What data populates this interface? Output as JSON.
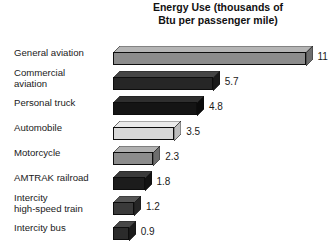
{
  "chart_data": {
    "type": "bar",
    "orientation": "horizontal",
    "title": "Energy Use (thousands of\nBtu per passenger mile)",
    "xlabel": "",
    "ylabel": "",
    "xlim": [
      0,
      11
    ],
    "grid": false,
    "legend": null,
    "style": "3d-isometric-horizontal-bars",
    "categories": [
      "General aviation",
      "Commercial\naviation",
      "Personal truck",
      "Automobile",
      "Motorcycle",
      "AMTRAK railroad",
      "Intercity\nhigh-speed train",
      "Intercity bus"
    ],
    "values": [
      11,
      5.7,
      4.8,
      3.5,
      2.3,
      1.8,
      1.2,
      0.9
    ],
    "value_labels": [
      "11",
      "5.7",
      "4.8",
      "3.5",
      "2.3",
      "1.8",
      "1.2",
      "0.9"
    ],
    "bar_colors": [
      "#8c8c8c",
      "#262626",
      "#141414",
      "#d8d8d8",
      "#8c8c8c",
      "#1c1c1c",
      "#3a3a3a",
      "#2b2b2b"
    ],
    "bar_top_colors": [
      "#b5b5b5",
      "#454545",
      "#2e2e2e",
      "#eaeaea",
      "#b0b0b0",
      "#3a3a3a",
      "#555555",
      "#474747"
    ],
    "bar_side_colors": [
      "#6d6d6d",
      "#1a1a1a",
      "#0b0b0b",
      "#bdbdbd",
      "#6d6d6d",
      "#121212",
      "#262626",
      "#1c1c1c"
    ]
  },
  "layout": {
    "px_per_unit": 17.5,
    "bar_origin_x": 113,
    "first_row_top": 40,
    "row_pitch": 25
  }
}
